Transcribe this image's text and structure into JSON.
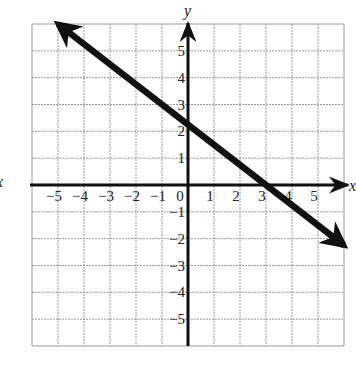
{
  "chart_data": {
    "type": "line",
    "title": "",
    "xlabel": "x",
    "ylabel": "y",
    "xlim": [
      -6,
      6
    ],
    "ylim": [
      -6,
      6
    ],
    "grid": true,
    "x_ticks": [
      -5,
      -4,
      -3,
      -2,
      -1,
      0,
      1,
      2,
      3,
      4,
      5
    ],
    "y_ticks": [
      -5,
      -4,
      -3,
      -2,
      -1,
      1,
      2,
      3,
      4,
      5
    ],
    "x_tick_labels": [
      "−5",
      "−4",
      "−3",
      "−2",
      "−1",
      "0",
      "1",
      "2",
      "3",
      "4",
      "5"
    ],
    "y_tick_labels": [
      "−5",
      "−4",
      "−3",
      "−2",
      "−1",
      "1",
      "2",
      "3",
      "4",
      "5"
    ],
    "series": [
      {
        "name": "line",
        "equation": "3x + 4y = 9",
        "slope": -0.75,
        "y_intercept": 2.25,
        "x_intercept": 3,
        "x": [
          -5,
          0,
          3,
          6
        ],
        "y": [
          6,
          2.25,
          0,
          -2.25
        ],
        "arrows": "both ends"
      }
    ]
  },
  "labels": {
    "x_axis": "x",
    "y_axis": "y",
    "left_edge_partial": "x"
  },
  "colors": {
    "grid": "#9a9a9a",
    "axis": "#111111",
    "line": "#111111",
    "background": "#ffffff"
  }
}
